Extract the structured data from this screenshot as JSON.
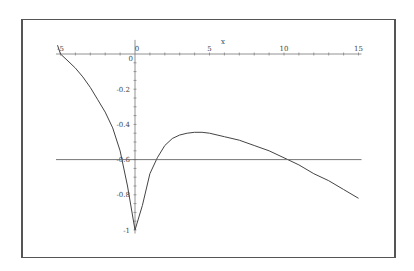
{
  "chart_data": {
    "type": "line",
    "title": "",
    "xlabel": "x",
    "ylabel": "",
    "xlim": [
      -5.3,
      15.2
    ],
    "ylim": [
      -1.02,
      0.05
    ],
    "grid": false,
    "legend": null,
    "x_ticks": [
      -5,
      0,
      5,
      10,
      15
    ],
    "x_tick_labels": [
      "-5",
      "0",
      "5",
      "10",
      "15"
    ],
    "y_ticks": [
      -0.2,
      -0.4,
      -0.6,
      -0.8,
      -1
    ],
    "y_tick_labels": [
      "-0.2",
      "-0.4",
      "-0.6",
      "-0.8",
      "-1"
    ],
    "series": [
      {
        "name": "curve",
        "x": [
          -5.2,
          -5,
          -4.5,
          -4,
          -3.5,
          -3,
          -2.5,
          -2,
          -1.5,
          -1,
          -0.5,
          0,
          0.5,
          1,
          1.5,
          2,
          2.5,
          3,
          3.5,
          4,
          4.5,
          5,
          6,
          7,
          8,
          9,
          10,
          11,
          12,
          13,
          14,
          15
        ],
        "y": [
          0.05,
          0.0,
          -0.04,
          -0.08,
          -0.13,
          -0.19,
          -0.26,
          -0.33,
          -0.42,
          -0.55,
          -0.75,
          -1.0,
          -0.86,
          -0.68,
          -0.59,
          -0.52,
          -0.48,
          -0.46,
          -0.45,
          -0.445,
          -0.445,
          -0.45,
          -0.47,
          -0.49,
          -0.52,
          -0.55,
          -0.59,
          -0.63,
          -0.68,
          -0.72,
          -0.77,
          -0.82
        ]
      },
      {
        "name": "horizontal line",
        "x": [
          -5.3,
          15.2
        ],
        "y": [
          -0.6,
          -0.6
        ]
      }
    ]
  }
}
